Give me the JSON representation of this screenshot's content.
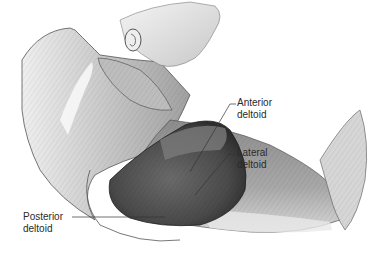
{
  "figure": {
    "labels": [
      {
        "id": "anterior",
        "line1": "Anterior",
        "line2": "deltoid"
      },
      {
        "id": "lateral",
        "line1": "Lateral",
        "line2": "deltoid"
      },
      {
        "id": "posterior",
        "line1": "Posterior",
        "line2": "deltoid"
      }
    ]
  },
  "colors": {
    "background": "#ffffff",
    "deltoid_dark": "#4a4a4a",
    "muscle_mid": "#9a9a9a",
    "skin_light": "#e6e6e6",
    "outline": "#3a3a3a",
    "label_text": "#2a2a2a"
  }
}
